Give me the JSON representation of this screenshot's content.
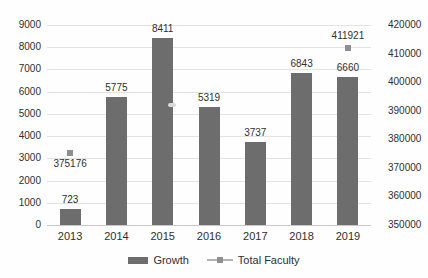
{
  "chart_data": {
    "type": "bar",
    "title": "",
    "categories": [
      "2013",
      "2014",
      "2015",
      "2016",
      "2017",
      "2018",
      "2019"
    ],
    "series": [
      {
        "name": "Growth",
        "chart_type": "bar",
        "axis": "left",
        "values": [
          723,
          5775,
          8411,
          5319,
          3737,
          6843,
          6660
        ],
        "data_labels": [
          "723",
          "5775",
          "8411",
          "5319",
          "3737",
          "6843",
          "6660"
        ]
      },
      {
        "name": "Total Faculty",
        "chart_type": "scatter",
        "axis": "right",
        "points": [
          {
            "category": "2013",
            "value": 375176,
            "label": "375176",
            "label_position": "below"
          },
          {
            "category": "2019",
            "value": 411921,
            "label": "411921",
            "label_position": "above"
          }
        ]
      }
    ],
    "left_axis": {
      "min": 0,
      "max": 9000,
      "step": 1000,
      "tick_labels": [
        "0",
        "1000",
        "2000",
        "3000",
        "4000",
        "5000",
        "6000",
        "7000",
        "8000",
        "9000"
      ]
    },
    "right_axis": {
      "min": 350000,
      "max": 420000,
      "step": 10000,
      "tick_labels": [
        "350000",
        "360000",
        "370000",
        "380000",
        "390000",
        "400000",
        "410000",
        "420000"
      ]
    },
    "grid": true,
    "legend_position": "bottom"
  },
  "colors": {
    "bar": "#6d6d6d",
    "marker": "#8f8f8f",
    "gridline": "#e3e3e3",
    "axis_line": "#c9c9c9",
    "text": "#2f2f2f",
    "legend_line": "#b3b3b3",
    "artifact": "#d9d9d6"
  }
}
